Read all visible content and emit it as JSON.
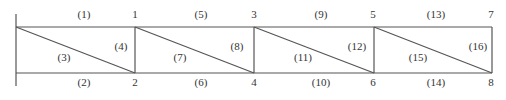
{
  "diagram": {
    "type": "truss",
    "stroke_color": "#555555",
    "text_color": "#333333",
    "support": {
      "x": 16,
      "y_top": 14,
      "y_bottom": 86
    },
    "top_chord_y": 27,
    "bottom_chord_y": 73,
    "panel_x": [
      16,
      135,
      254,
      374,
      492
    ],
    "nodes": [
      {
        "id": "1",
        "x": 135,
        "y": 15
      },
      {
        "id": "2",
        "x": 135,
        "y": 83
      },
      {
        "id": "3",
        "x": 254,
        "y": 15
      },
      {
        "id": "4",
        "x": 254,
        "y": 83
      },
      {
        "id": "5",
        "x": 373,
        "y": 15
      },
      {
        "id": "6",
        "x": 373,
        "y": 83
      },
      {
        "id": "7",
        "x": 491,
        "y": 15
      },
      {
        "id": "8",
        "x": 491,
        "y": 83
      }
    ],
    "members": [
      {
        "id": "(1)",
        "x": 84,
        "y": 15
      },
      {
        "id": "(2)",
        "x": 84,
        "y": 83
      },
      {
        "id": "(3)",
        "x": 64,
        "y": 58
      },
      {
        "id": "(4)",
        "x": 121,
        "y": 47
      },
      {
        "id": "(5)",
        "x": 201,
        "y": 15
      },
      {
        "id": "(6)",
        "x": 201,
        "y": 83
      },
      {
        "id": "(7)",
        "x": 180,
        "y": 58
      },
      {
        "id": "(8)",
        "x": 237,
        "y": 47
      },
      {
        "id": "(9)",
        "x": 321,
        "y": 15
      },
      {
        "id": "(10)",
        "x": 321,
        "y": 83
      },
      {
        "id": "(11)",
        "x": 303,
        "y": 58
      },
      {
        "id": "(12)",
        "x": 357,
        "y": 47
      },
      {
        "id": "(13)",
        "x": 436,
        "y": 15
      },
      {
        "id": "(14)",
        "x": 436,
        "y": 83
      },
      {
        "id": "(15)",
        "x": 418,
        "y": 58
      },
      {
        "id": "(16)",
        "x": 478,
        "y": 47
      }
    ]
  }
}
